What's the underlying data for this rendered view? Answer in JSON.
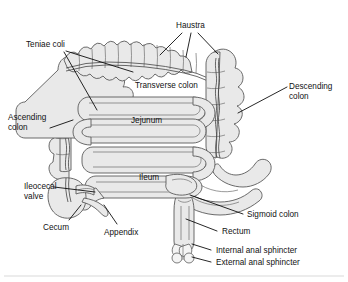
{
  "figure": {
    "colors": {
      "organ_fill": "#e9e9e9",
      "organ_fill_light": "#f2f2f2",
      "organ_stroke": "#5a5a5a",
      "inner_stroke": "#6e6e6e",
      "leader_line": "#000000",
      "text": "#111111",
      "background": "#ffffff",
      "frame": "#cccccc"
    }
  },
  "labels": {
    "teniae_coli": "Teniae coli",
    "haustra": "Haustra",
    "transverse_colon": "Transverse colon",
    "descending_colon_line1": "Descending",
    "descending_colon_line2": "colon",
    "ascending_colon_line1": "Ascending",
    "ascending_colon_line2": "colon",
    "jejunum": "Jejunum",
    "ileum": "Ileum",
    "ileocecal_valve_line1": "Ileocecal",
    "ileocecal_valve_line2": "valve",
    "cecum": "Cecum",
    "appendix": "Appendix",
    "sigmoid_colon": "Sigmoid colon",
    "rectum": "Rectum",
    "internal_anal_sphincter": "Internal anal sphincter",
    "external_anal_sphincter": "External anal sphincter"
  }
}
